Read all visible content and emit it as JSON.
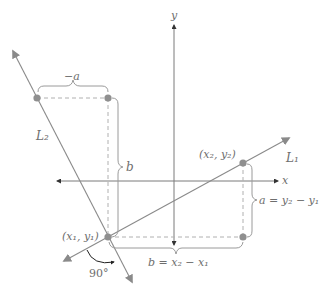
{
  "diagram": {
    "colors": {
      "line": "#8a8a8a",
      "axis": "#7a7a7a",
      "point": "#8f8f8f",
      "dashed": "#b0b0b0",
      "brace": "#9a9a9a",
      "text": "#6e6e6e"
    },
    "axes": {
      "x_label": "x",
      "y_label": "y"
    },
    "lines": [
      {
        "label": "L₁",
        "name": "L1"
      },
      {
        "label": "L₂",
        "name": "L2"
      }
    ],
    "points": {
      "p1": "(x₁, y₁)",
      "p2": "(x₂, y₂)"
    },
    "labels": {
      "neg_a": "−a",
      "b_vertical": "b",
      "a_eq": "a = y₂ − y₁",
      "b_eq": "b = x₂ − x₁",
      "angle": "90°"
    }
  }
}
